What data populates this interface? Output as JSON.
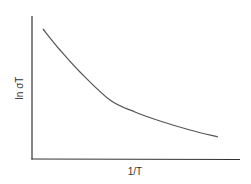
{
  "chart_data": {
    "type": "line",
    "title": "",
    "xlabel": "1/T",
    "ylabel": "ln σT",
    "grid": false,
    "legend": null,
    "x_ticks": [],
    "y_ticks": [],
    "series": [
      {
        "name": "ln σT vs 1/T",
        "description": "monotonically decreasing convex curve",
        "points_px": [
          [
            43,
            29
          ],
          [
            60,
            50
          ],
          [
            80,
            72
          ],
          [
            110,
            100
          ],
          [
            135,
            112
          ],
          [
            160,
            121
          ],
          [
            190,
            130
          ],
          [
            218,
            137
          ]
        ]
      }
    ]
  },
  "colors": {
    "axis": "#333333",
    "curve": "#555555",
    "text": "#333333"
  }
}
